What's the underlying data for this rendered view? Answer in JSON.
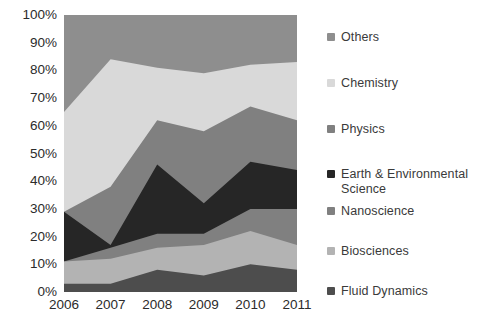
{
  "chart_data": {
    "type": "area",
    "title": "",
    "subtitle": "",
    "xlabel": "",
    "ylabel": "",
    "stacked": true,
    "normalized": true,
    "grid": false,
    "legend_position": "right",
    "categories": [
      "2006",
      "2007",
      "2008",
      "2009",
      "2010",
      "2011"
    ],
    "x_tick_labels": [
      "2006",
      "2007",
      "2008",
      "2009",
      "2010",
      "2011"
    ],
    "y_tick_labels": [
      "0%",
      "10%",
      "20%",
      "30%",
      "40%",
      "50%",
      "60%",
      "70%",
      "80%",
      "90%",
      "100%"
    ],
    "y_tick_values": [
      0,
      10,
      20,
      30,
      40,
      50,
      60,
      70,
      80,
      90,
      100
    ],
    "ylim": [
      0,
      100
    ],
    "series": [
      {
        "name": "Fluid Dynamics",
        "color": "#4d4d4d",
        "values": [
          3,
          3,
          8,
          6,
          10,
          8
        ],
        "cumulative_top": [
          3,
          3,
          8,
          6,
          10,
          8
        ]
      },
      {
        "name": "Biosciences",
        "color": "#b3b3b3",
        "values": [
          8,
          9,
          8,
          11,
          12,
          9
        ],
        "cumulative_top": [
          11,
          12,
          16,
          17,
          22,
          17
        ]
      },
      {
        "name": "Nanoscience",
        "color": "#808080",
        "values": [
          0,
          4,
          5,
          4,
          8,
          13
        ],
        "cumulative_top": [
          11,
          16,
          21,
          21,
          30,
          30
        ]
      },
      {
        "name": "Earth & Environmental Science",
        "color": "#262626",
        "values": [
          18,
          1,
          25,
          11,
          17,
          14
        ],
        "cumulative_top": [
          29,
          17,
          46,
          32,
          47,
          44
        ]
      },
      {
        "name": "Physics",
        "color": "#808080",
        "values": [
          0,
          21,
          16,
          26,
          20,
          18
        ],
        "cumulative_top": [
          29,
          38,
          62,
          58,
          67,
          62
        ]
      },
      {
        "name": "Chemistry",
        "color": "#d9d9d9",
        "values": [
          36,
          46,
          19,
          21,
          15,
          21
        ],
        "cumulative_top": [
          65,
          84,
          81,
          79,
          82,
          83
        ]
      },
      {
        "name": "Others",
        "color": "#8e8e8e",
        "values": [
          35,
          16,
          19,
          21,
          18,
          17
        ],
        "cumulative_top": [
          100,
          100,
          100,
          100,
          100,
          100
        ]
      }
    ]
  },
  "legend": {
    "items": [
      {
        "label": "Others",
        "color": "#8e8e8e"
      },
      {
        "label": "Chemistry",
        "color": "#d9d9d9"
      },
      {
        "label": "Physics",
        "color": "#808080"
      },
      {
        "label": "Earth & Environmental Science",
        "color": "#262626"
      },
      {
        "label": "Nanoscience",
        "color": "#808080"
      },
      {
        "label": "Biosciences",
        "color": "#b3b3b3"
      },
      {
        "label": "Fluid Dynamics",
        "color": "#4d4d4d"
      }
    ]
  },
  "colors": {
    "others": "#8e8e8e",
    "chemistry": "#d9d9d9",
    "physics": "#808080",
    "earth_environmental_science": "#262626",
    "nanoscience": "#808080",
    "biosciences": "#b3b3b3",
    "fluid_dynamics": "#4d4d4d",
    "text": "#2b2b2b",
    "background": "#ffffff"
  }
}
